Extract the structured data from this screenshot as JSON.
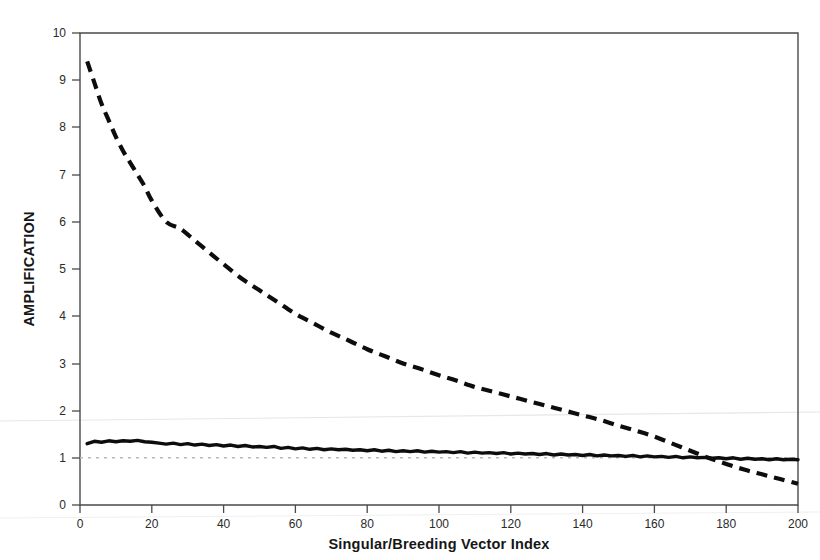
{
  "chart_data": {
    "type": "line",
    "title": "",
    "xlabel": "Singular/Breeding Vector Index",
    "ylabel": "AMPLIFICATION",
    "xlim": [
      0,
      200
    ],
    "ylim": [
      0,
      10
    ],
    "grid": false,
    "legend_position": "none",
    "xticks": [
      0,
      20,
      40,
      60,
      80,
      100,
      120,
      140,
      160,
      180,
      200
    ],
    "xtick_labels": [
      "0",
      "20",
      "40",
      "60",
      "80",
      "100",
      "120",
      "140",
      "160",
      "180",
      "200"
    ],
    "yticks": [
      0,
      1,
      2,
      3,
      4,
      5,
      6,
      7,
      8,
      9,
      10
    ],
    "ytick_labels": [
      "0",
      "1",
      "2",
      "3",
      "4",
      "5",
      "6",
      "7",
      "8",
      "9",
      "10"
    ],
    "series": [
      {
        "name": "singular-vector-amplification",
        "style": "dashed",
        "color": "#0d0d0d",
        "x": [
          2,
          4,
          6,
          8,
          10,
          12,
          14,
          16,
          18,
          20,
          24,
          28,
          32,
          36,
          40,
          45,
          50,
          55,
          60,
          65,
          70,
          75,
          80,
          85,
          90,
          95,
          100,
          105,
          110,
          115,
          120,
          125,
          130,
          135,
          140,
          145,
          150,
          155,
          160,
          165,
          170,
          175,
          180,
          185,
          190,
          195,
          200
        ],
        "values": [
          9.4,
          8.95,
          8.5,
          8.15,
          7.8,
          7.5,
          7.25,
          7.0,
          6.75,
          6.45,
          6.0,
          5.85,
          5.6,
          5.35,
          5.1,
          4.8,
          4.55,
          4.3,
          4.05,
          3.85,
          3.65,
          3.48,
          3.3,
          3.15,
          3.0,
          2.88,
          2.75,
          2.63,
          2.5,
          2.4,
          2.3,
          2.2,
          2.1,
          2.0,
          1.9,
          1.8,
          1.68,
          1.57,
          1.45,
          1.3,
          1.15,
          1.0,
          0.87,
          0.75,
          0.65,
          0.55,
          0.45
        ]
      },
      {
        "name": "breeding-vector-amplification",
        "style": "solid",
        "color": "#0d0d0d",
        "x": [
          2,
          4,
          6,
          8,
          10,
          12,
          14,
          16,
          18,
          20,
          22,
          24,
          26,
          28,
          30,
          32,
          34,
          36,
          38,
          40,
          42,
          44,
          46,
          48,
          50,
          52,
          54,
          56,
          58,
          60,
          62,
          64,
          66,
          68,
          70,
          72,
          74,
          76,
          78,
          80,
          82,
          84,
          86,
          88,
          90,
          92,
          94,
          96,
          98,
          100,
          102,
          104,
          106,
          108,
          110,
          112,
          114,
          116,
          118,
          120,
          122,
          124,
          126,
          128,
          130,
          132,
          134,
          136,
          138,
          140,
          142,
          144,
          146,
          148,
          150,
          152,
          154,
          156,
          158,
          160,
          162,
          164,
          166,
          168,
          170,
          172,
          174,
          176,
          178,
          180,
          182,
          184,
          186,
          188,
          190,
          192,
          194,
          196,
          198,
          200
        ],
        "values": [
          1.3,
          1.35,
          1.33,
          1.36,
          1.34,
          1.36,
          1.35,
          1.37,
          1.34,
          1.33,
          1.31,
          1.29,
          1.31,
          1.28,
          1.3,
          1.27,
          1.29,
          1.26,
          1.28,
          1.25,
          1.27,
          1.24,
          1.26,
          1.23,
          1.24,
          1.22,
          1.24,
          1.2,
          1.22,
          1.19,
          1.21,
          1.18,
          1.2,
          1.17,
          1.19,
          1.17,
          1.18,
          1.16,
          1.17,
          1.15,
          1.17,
          1.14,
          1.16,
          1.13,
          1.15,
          1.13,
          1.15,
          1.12,
          1.14,
          1.12,
          1.13,
          1.11,
          1.13,
          1.1,
          1.12,
          1.1,
          1.11,
          1.09,
          1.11,
          1.08,
          1.1,
          1.08,
          1.09,
          1.07,
          1.09,
          1.06,
          1.08,
          1.06,
          1.07,
          1.05,
          1.07,
          1.04,
          1.06,
          1.04,
          1.05,
          1.03,
          1.05,
          1.02,
          1.04,
          1.02,
          1.03,
          1.01,
          1.03,
          1.0,
          1.02,
          1.0,
          1.01,
          0.99,
          1.0,
          0.98,
          1.0,
          0.97,
          0.99,
          0.97,
          0.98,
          0.96,
          0.98,
          0.96,
          0.97,
          0.96
        ]
      },
      {
        "name": "unity-reference-line",
        "style": "dotted",
        "color": "#b9b9b9",
        "x": [
          0,
          200
        ],
        "values": [
          1.0,
          1.0
        ]
      }
    ],
    "annotations": {
      "crossover_index": 172,
      "crossover_value": 1.0
    }
  }
}
